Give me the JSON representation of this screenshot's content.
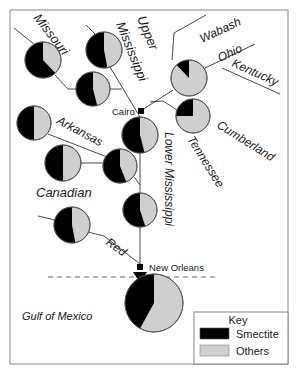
{
  "colors": {
    "smectite": "#000000",
    "others": "#cfcfcf",
    "line": "#333333",
    "frame": "#888888"
  },
  "rivers": {
    "missouri": "Missouri",
    "upper_mississippi_1": "Upper",
    "upper_mississippi_2": "Mississippi",
    "wabash": "Wabash",
    "ohio": "Ohio",
    "kentucky": "Kentucky",
    "cumberland": "Cumberland",
    "tennessee": "Tennessee",
    "arkansas": "Arkansas",
    "canadian": "Canadian",
    "lower_mississippi": "Lower Mississippi",
    "red": "Red"
  },
  "places": {
    "cairo": "Cairo",
    "new_orleans": "New Orleans",
    "gulf": "Gulf of Mexico"
  },
  "legend": {
    "title": "Key",
    "items": [
      {
        "label": "Smectite",
        "color": "#000000"
      },
      {
        "label": "Others",
        "color": "#cfcfcf"
      }
    ]
  },
  "pies": [
    {
      "id": "missouri",
      "smectite_pct": 62
    },
    {
      "id": "upper-mississippi",
      "smectite_pct": 53
    },
    {
      "id": "missouri-upper-confluence",
      "smectite_pct": 54
    },
    {
      "id": "ohio",
      "smectite_pct": 12
    },
    {
      "id": "cumberland-tennessee",
      "smectite_pct": 25
    },
    {
      "id": "below-cairo",
      "smectite_pct": 54
    },
    {
      "id": "arkansas",
      "smectite_pct": 50
    },
    {
      "id": "canadian",
      "smectite_pct": 50
    },
    {
      "id": "arkansas-confluence",
      "smectite_pct": 56
    },
    {
      "id": "lower-mississippi",
      "smectite_pct": 55
    },
    {
      "id": "red",
      "smectite_pct": 53
    },
    {
      "id": "gulf-of-mexico",
      "smectite_pct": 42
    }
  ]
}
